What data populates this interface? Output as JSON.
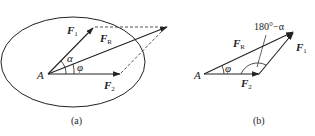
{
  "figure_a": {
    "caption": "(a)",
    "point": "A",
    "vectors": {
      "F1": {
        "main": "F",
        "sub": "1"
      },
      "F2": {
        "main": "F",
        "sub": "2"
      },
      "FR": {
        "main": "F",
        "sub": "R"
      }
    },
    "angles": {
      "alpha": "α",
      "phi": "φ"
    }
  },
  "figure_b": {
    "caption": "(b)",
    "point": "A",
    "vectors": {
      "F1": {
        "main": "F",
        "sub": "1"
      },
      "F2": {
        "main": "F",
        "sub": "2"
      },
      "FR": {
        "main": "F",
        "sub": "R"
      }
    },
    "angles": {
      "phi": "φ",
      "supplement": "180°−α"
    }
  },
  "colors": {
    "stroke": "#222222",
    "background": "#ffffff"
  }
}
